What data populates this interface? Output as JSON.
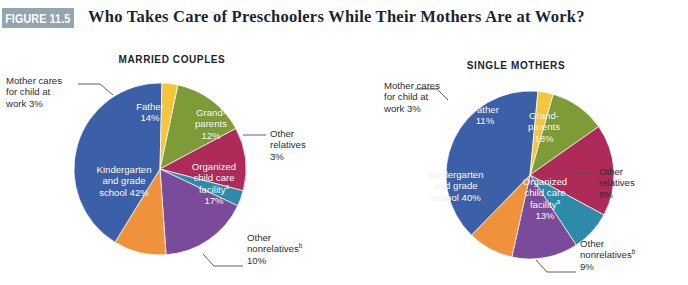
{
  "header": {
    "figure_badge": "FIGURE 11.5",
    "title": "Who Takes Care of Preschoolers While Their Mothers Are at Work?",
    "badge_color": "#93a6b0"
  },
  "palette": {
    "father": "#7d9b36",
    "grandparents": "#ae2a59",
    "other_relatives": "#2d8aa8",
    "organized_child_care": "#7a4a9b",
    "other_nonrelatives": "#f0913c",
    "kindergarten": "#3c60a8",
    "mother_cares": "#f3c63e"
  },
  "chart_data": [
    {
      "type": "pie",
      "title": "MARRIED COUPLES",
      "categories": [
        "Father",
        "Grandparents",
        "Other relatives",
        "Organized child care facility",
        "Other nonrelatives",
        "Kindergarten and grade school",
        "Mother cares for child at work"
      ],
      "values": [
        14,
        12,
        3,
        17,
        10,
        42,
        3
      ],
      "unit": "%",
      "legend": "labels-on-slices",
      "labels": {
        "mother_cares": {
          "line1": "Mother cares",
          "line2": "for child at",
          "line3": "work  3%"
        },
        "father": {
          "line1": "Father",
          "line2": "14%"
        },
        "grandparents": {
          "line1": "Grand-",
          "line2": "parents",
          "line3": "12%"
        },
        "other_relatives": {
          "line1": "Other",
          "line2": "relatives",
          "line3": "3%"
        },
        "organized": {
          "line1": "Organized",
          "line2": "child care",
          "line3": "facility",
          "sup": "a",
          "line4": "17%"
        },
        "kindergarten": {
          "line1": "Kindergarten",
          "line2": "and grade",
          "line3": "school  42%"
        },
        "other_nonrelatives": {
          "line1": "Other",
          "line2": "nonrelatives",
          "sup": "b",
          "line3": "10%"
        }
      }
    },
    {
      "type": "pie",
      "title": "SINGLE MOTHERS",
      "categories": [
        "Father",
        "Grandparents",
        "Other relatives",
        "Organized child care facility",
        "Other nonrelatives",
        "Kindergarten and grade school",
        "Mother cares for child at work"
      ],
      "values": [
        11,
        18,
        8,
        13,
        9,
        40,
        3
      ],
      "unit": "%",
      "legend": "labels-on-slices",
      "labels": {
        "mother_cares": {
          "line1": "Mother cares",
          "line2": "for child at",
          "line3": "work  3%"
        },
        "father": {
          "line1": "Father",
          "line2": "11%"
        },
        "grandparents": {
          "line1": "Grand-",
          "line2": "parents",
          "line3": "18%"
        },
        "other_relatives": {
          "line1": "Other",
          "line2": "relatives",
          "line3": "8%"
        },
        "organized": {
          "line1": "Organized",
          "line2": "child care",
          "line3": "facility",
          "sup": "a",
          "line4": "13%"
        },
        "kindergarten": {
          "line1": "Kindergarten",
          "line2": "and grade",
          "line3": "school  40%"
        },
        "other_nonrelatives": {
          "line1": "Other",
          "line2": "nonrelatives",
          "sup": "b",
          "line3": "9%"
        }
      }
    }
  ]
}
